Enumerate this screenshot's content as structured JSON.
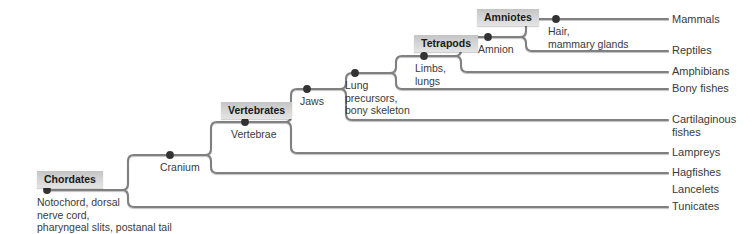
{
  "diagram": {
    "type": "cladogram",
    "line_color": "#808080",
    "node_color": "#333333",
    "clade_box_color": "#d4d4d4",
    "background": "#ffffff"
  },
  "clades": [
    {
      "id": "chordates",
      "label": "Chordates",
      "x": 37,
      "y": 171
    },
    {
      "id": "vertebrates",
      "label": "Vertebrates",
      "x": 221,
      "y": 102
    },
    {
      "id": "tetrapods",
      "label": "Tetrapods",
      "x": 414,
      "y": 35
    },
    {
      "id": "amniotes",
      "label": "Amniotes",
      "x": 477,
      "y": 9
    }
  ],
  "nodes": [
    {
      "id": "root",
      "label": "Notochord, dorsal\nnerve cord,\npharyngeal slits, postanal tail",
      "dot_x": 47,
      "dot_y": 190,
      "text_x": 37,
      "text_y": 196
    },
    {
      "id": "cranium",
      "label": "Cranium",
      "dot_x": 170,
      "dot_y": 155,
      "text_x": 160,
      "text_y": 161
    },
    {
      "id": "vertebrae",
      "label": "Vertebrae",
      "dot_x": 245,
      "dot_y": 122,
      "text_x": 231,
      "text_y": 128
    },
    {
      "id": "jaws",
      "label": "Jaws",
      "dot_x": 307,
      "dot_y": 89,
      "text_x": 300,
      "text_y": 95
    },
    {
      "id": "lung",
      "label": "Lung\nprecursors,\nbony skeleton",
      "dot_x": 355,
      "dot_y": 73,
      "text_x": 345,
      "text_y": 79
    },
    {
      "id": "limbs",
      "label": "Limbs,\nlungs",
      "dot_x": 424,
      "dot_y": 56,
      "text_x": 415,
      "text_y": 62
    },
    {
      "id": "amnion",
      "label": "Amnion",
      "dot_x": 488,
      "dot_y": 37,
      "text_x": 478,
      "text_y": 43
    },
    {
      "id": "hair",
      "label": "Hair,\nmammary glands",
      "dot_x": 556,
      "dot_y": 19,
      "text_x": 548,
      "text_y": 25
    }
  ],
  "taxa": [
    {
      "id": "mammals",
      "label": "Mammals",
      "y": 20,
      "label_x": 672,
      "label_y": 13,
      "branch_x1": 556,
      "branch_x2": 668
    },
    {
      "id": "reptiles",
      "label": "Reptiles",
      "y": 51,
      "label_x": 672,
      "label_y": 44,
      "branch_x1": 520,
      "branch_x2": 668
    },
    {
      "id": "amphibians",
      "label": "Amphibians",
      "y": 72,
      "label_x": 672,
      "label_y": 65,
      "branch_x1": 455,
      "branch_x2": 668
    },
    {
      "id": "bonyfishes",
      "label": "Bony fishes",
      "y": 89,
      "label_x": 672,
      "label_y": 82,
      "branch_x1": 390,
      "branch_x2": 668
    },
    {
      "id": "cartilaginous",
      "label": "Cartilaginous\nfishes",
      "y": 120,
      "label_x": 672,
      "label_y": 113,
      "branch_x1": 340,
      "branch_x2": 668
    },
    {
      "id": "lampreys",
      "label": "Lampreys",
      "y": 153,
      "label_x": 672,
      "label_y": 146,
      "branch_x1": 285,
      "branch_x2": 668
    },
    {
      "id": "hagfishes",
      "label": "Hagfishes",
      "y": 173,
      "label_x": 672,
      "label_y": 166,
      "branch_x1": 205,
      "branch_x2": 668
    },
    {
      "id": "lancelets",
      "label": "Lancelets",
      "y": 190,
      "label_x": 672,
      "label_y": 183,
      "branch_x1": 190,
      "branch_x2": 668
    },
    {
      "id": "tunicates",
      "label": "Tunicates",
      "y": 207,
      "label_x": 672,
      "label_y": 200,
      "branch_x1": 128,
      "branch_x2": 668
    }
  ],
  "branch_paths": [
    "M47,190 H122",
    "M122,190 Q128,190 128,196 V201 Q128,207 134,207 H668",
    "M122,190 Q128,190 128,184 V161 Q128,155 134,155 H205",
    "M205,155 Q211,155 211,161 V167 Q211,173 217,173 H668",
    "M205,155 Q211,155 211,149 V128 Q211,122 217,122 H285",
    "M285,122 Q291,122 291,128 V147 Q291,153 297,153 H668",
    "M285,122 Q291,122 291,116 V95 Q291,89 297,89 H340",
    "M340,89 Q346,89 346,95 V114 Q346,120 352,120 H668",
    "M340,89 Q346,89 346,83 V79 Q346,73 352,73 H390",
    "M390,73 Q396,73 396,79 V83 Q396,89 402,89 H668",
    "M390,73 Q396,73 396,67 V62 Q396,56 402,56 H455",
    "M455,56 Q461,56 461,62 V66 Q461,72 467,72 H668",
    "M455,56 Q461,56 461,50 V43 Q461,37 467,37 H520",
    "M520,37 Q526,37 526,43 V45 Q526,51 532,51 H668",
    "M520,37 Q526,37 526,31 V25 Q526,19 532,19 H668"
  ]
}
